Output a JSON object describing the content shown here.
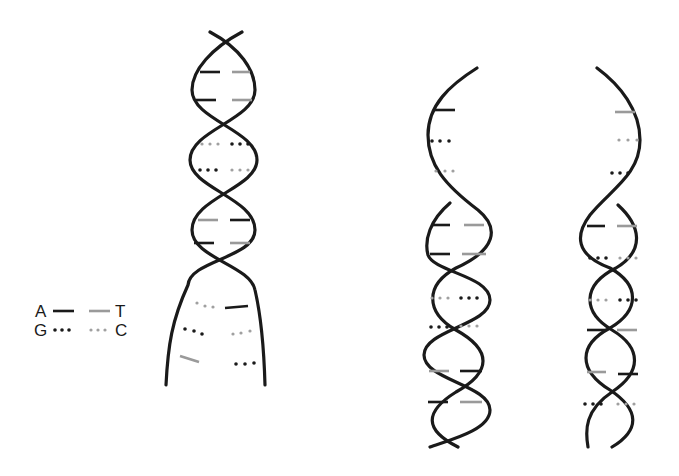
{
  "diagram": {
    "colors": {
      "strand": "#1a1a1a",
      "dark_base": "#1a1a1a",
      "light_base": "#9a9a9a"
    },
    "legend": {
      "pairs": [
        {
          "left": "A",
          "right": "T",
          "style": "solid-line"
        },
        {
          "left": "G",
          "right": "C",
          "style": "dotted-line"
        }
      ]
    },
    "helices": [
      {
        "id": "parent",
        "description": "Parent double helix unwinding at bottom (replication fork)"
      },
      {
        "id": "daughter-1",
        "description": "Daughter double helix, left"
      },
      {
        "id": "daughter-2",
        "description": "Daughter double helix, right"
      }
    ]
  }
}
